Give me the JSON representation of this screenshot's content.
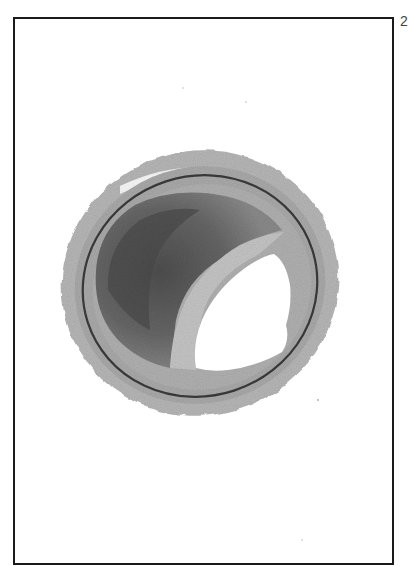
{
  "figure": {
    "frame_color": "#1a1a1a",
    "background_color": "#ffffff",
    "edge_mark": "2",
    "tones": {
      "adventitia": "#b4b4b4",
      "media": "#a8a8a8",
      "elastic_lamina": "#3a3a3a",
      "plaque_dark": "#5a5a5a",
      "plaque_core": "#6e6e6e",
      "fibrous_cap": "#c2c2c2",
      "lumen": "#ffffff"
    }
  }
}
